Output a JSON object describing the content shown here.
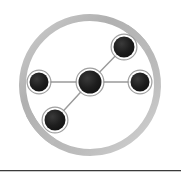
{
  "canvas": {
    "width": 181,
    "height": 181,
    "background_color": "#ffffff"
  },
  "logo": {
    "name": "network-node-logo",
    "description": "Gray broken ring enclosing a five-node connected network graph",
    "ring": {
      "center_x": 90,
      "center_y": 85,
      "outer_radius": 71,
      "thickness": 7,
      "color": "#b4b4b4",
      "color_light": "#d8d8d8",
      "gaps": [
        {
          "name": "upper-right-gap",
          "start_deg": 32,
          "end_deg": 58
        },
        {
          "name": "lower-left-gap",
          "start_deg": 206,
          "end_deg": 238
        }
      ]
    },
    "node_color": "#1a1a1a",
    "node_ring_color": "#8f8f8f",
    "edge_color": "#9a9a9a",
    "edge_width": 1.4,
    "nodes": [
      {
        "id": "center",
        "label": "center-node",
        "cx": 90,
        "cy": 82,
        "r": 11.5
      },
      {
        "id": "left",
        "label": "left-node",
        "cx": 39,
        "cy": 82,
        "r": 9.5
      },
      {
        "id": "right",
        "label": "right-node",
        "cx": 140,
        "cy": 82,
        "r": 9.5
      },
      {
        "id": "top-right",
        "label": "top-right-node",
        "cx": 124,
        "cy": 47,
        "r": 10.5
      },
      {
        "id": "bottom-left",
        "label": "bottom-left-node",
        "cx": 55,
        "cy": 120,
        "r": 10.5
      }
    ],
    "edges": [
      {
        "id": "center-left",
        "from": "center",
        "to": "left"
      },
      {
        "id": "center-right",
        "from": "center",
        "to": "right"
      },
      {
        "id": "center-top-right",
        "from": "center",
        "to": "top-right"
      },
      {
        "id": "center-bottom-left",
        "from": "center",
        "to": "bottom-left"
      }
    ]
  },
  "divider": {
    "name": "bottom-divider",
    "y": 170,
    "color": "#3a3a3a",
    "shadow_color": "#c9c9c9"
  }
}
